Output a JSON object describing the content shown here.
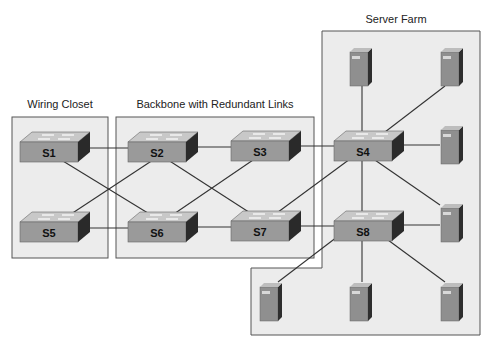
{
  "diagram": {
    "title_wiring_closet": "Wiring Closet",
    "title_backbone": "Backbone with Redundant Links",
    "title_server_farm": "Server Farm",
    "colors": {
      "zone_fill": "#ececec",
      "zone_stroke": "#555555",
      "link": "#333333",
      "switch_front": "#9a9a9a",
      "switch_top": "#c8c8c8",
      "switch_side": "#2a2a2a",
      "server_front": "#8f8f8f",
      "server_side": "#2e2e2e"
    },
    "switches": [
      {
        "id": "S1",
        "label": "S1"
      },
      {
        "id": "S2",
        "label": "S2"
      },
      {
        "id": "S3",
        "label": "S3"
      },
      {
        "id": "S4",
        "label": "S4"
      },
      {
        "id": "S5",
        "label": "S5"
      },
      {
        "id": "S6",
        "label": "S6"
      },
      {
        "id": "S7",
        "label": "S7"
      },
      {
        "id": "S8",
        "label": "S8"
      }
    ],
    "links": [
      [
        "S1",
        "S2"
      ],
      [
        "S2",
        "S3"
      ],
      [
        "S3",
        "S4"
      ],
      [
        "S5",
        "S6"
      ],
      [
        "S6",
        "S7"
      ],
      [
        "S7",
        "S8"
      ],
      [
        "S1",
        "S6"
      ],
      [
        "S5",
        "S2"
      ],
      [
        "S2",
        "S7"
      ],
      [
        "S6",
        "S3"
      ],
      [
        "S4",
        "S7"
      ],
      [
        "S4",
        "S8"
      ]
    ],
    "servers_count": 8
  }
}
